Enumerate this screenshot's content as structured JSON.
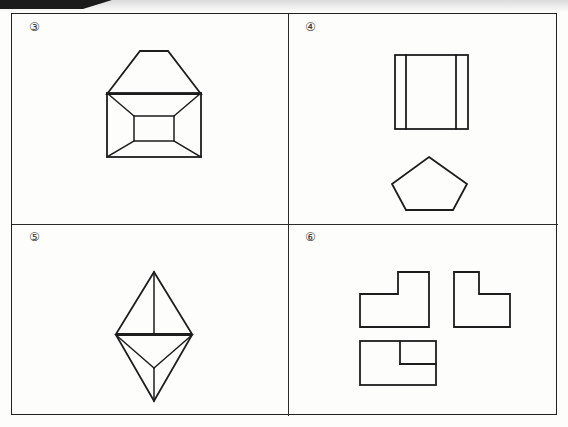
{
  "document": {
    "type": "worksheet",
    "title": "Orthographic projection exercise — four problem panels",
    "background_color": "#fdfdfc",
    "ink_color": "#1d1d1d",
    "frame": {
      "border_color": "#222222"
    }
  },
  "artifact": {
    "name": "scan-edge-shadow",
    "color": "#1b1b1b",
    "description": "dark tapered scan bar across the top-left corner"
  },
  "panels": [
    {
      "id": "q3",
      "label": "③",
      "label_plain": "3",
      "figures": [
        {
          "name": "trapezoid-front-view",
          "shape": "trapezoid",
          "points": "39,5 67,5 100,48 6,48"
        },
        {
          "name": "rectangle-top-view",
          "shape": "rectangle-with-inner-rectangle-and-diagonals",
          "outer": "6,0 100,0 100,64 6,64",
          "inner": "33,23 73,23 73,48 33,48",
          "diagonals": [
            "6,0 33,23",
            "100,0 73,23",
            "6,64 33,48",
            "100,64 73,48"
          ]
        }
      ]
    },
    {
      "id": "q4",
      "label": "④",
      "label_plain": "4",
      "figures": [
        {
          "name": "square-with-vertical-lines",
          "shape": "square",
          "outer": "0,0 73,0 73,74 0,74",
          "inner_lines": [
            "11,0 11,74",
            "61,0 61,74"
          ]
        },
        {
          "name": "pentagon-view",
          "shape": "pentagon",
          "points": "37,0 75,27 61,53 14,53 0,27"
        }
      ]
    },
    {
      "id": "q5",
      "label": "⑤",
      "label_plain": "5",
      "figures": [
        {
          "name": "triangle-up-with-median",
          "shape": "triangle",
          "points": "38,0 76,62 0,62",
          "inner_lines": [
            "38,0 38,62"
          ]
        },
        {
          "name": "triangle-down-with-center-spokes",
          "shape": "inverted-triangle",
          "points": "0,0 76,0 38,66",
          "inner_lines": [
            "0,0 38,33",
            "76,0 38,33",
            "38,33 38,66"
          ]
        }
      ]
    },
    {
      "id": "q6",
      "label": "⑥",
      "label_plain": "6",
      "figures": [
        {
          "name": "l-shape-left-view",
          "shape": "L-polygon",
          "points": "0,22 38,22 38,0 69,0 69,22 69,55 0,55"
        },
        {
          "name": "l-shape-right-view",
          "shape": "L-polygon",
          "points": "0,0 25,0 25,22 56,22 56,55 0,55 0,22"
        },
        {
          "name": "rectangle-with-notch-view",
          "shape": "rectangle-with-inner-notch",
          "outer": "0,0 76,0 76,44 0,44",
          "inner_lines": [
            "40,0 40,23",
            "40,23 76,23"
          ]
        }
      ]
    }
  ]
}
